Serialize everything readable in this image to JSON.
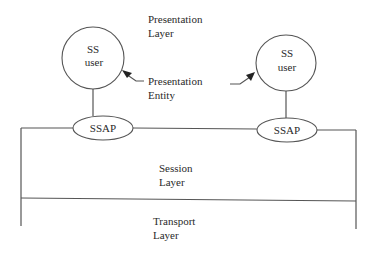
{
  "diagram": {
    "labels": {
      "presentation_layer": [
        "Presentation",
        "Layer"
      ],
      "presentation_entity": [
        "Presentation",
        "Entity"
      ],
      "session_layer": [
        "Session",
        "Layer"
      ],
      "transport_layer": [
        "Transport",
        "Layer"
      ]
    },
    "nodes": {
      "left_user": [
        "SS",
        "user"
      ],
      "right_user": [
        "SS",
        "user"
      ],
      "left_sap": "SSAP",
      "right_sap": "SSAP"
    },
    "colors": {
      "line": "#555555",
      "text": "#2a2a2a",
      "background": "#ffffff"
    }
  }
}
